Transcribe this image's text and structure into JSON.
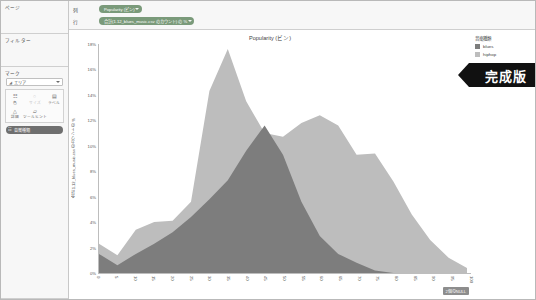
{
  "sidebar": {
    "pages_title": "ページ",
    "filters_title": "フィルター",
    "marks_title": "マーク",
    "marks_type": "エリア",
    "marks_type_icon": "area-mark-icon",
    "mark_buttons": [
      {
        "icon": "color-icon",
        "glyph": "⠿",
        "label": "色"
      },
      {
        "icon": "size-icon",
        "glyph": "○",
        "label": "サイズ",
        "dim": true
      },
      {
        "icon": "label-icon",
        "glyph": "▤",
        "label": "ラベル"
      },
      {
        "icon": "detail-icon",
        "glyph": "△",
        "label": "詳細"
      },
      {
        "icon": "tooltip-icon",
        "glyph": "◱",
        "label": "ツールヒント"
      }
    ],
    "marks_pill": "音楽種類",
    "marks_pill_icon": "dimension-pill-icon"
  },
  "shelves": {
    "columns_label": "列",
    "rows_label": "行",
    "columns_pill": "Popularity (ビン)",
    "rows_pill": "合計(1.12_blues_music.csv のカウント) の %"
  },
  "legend": {
    "title": "音楽種類",
    "items": [
      {
        "label": "blues",
        "color": "#7d7d7d"
      },
      {
        "label": "hiphop",
        "color": "#bdbdbd"
      }
    ]
  },
  "ribbon": {
    "label": "完成版"
  },
  "null_badge": {
    "label": "2個のNULL"
  },
  "chart_data": {
    "type": "area",
    "title": "Popularity (ビン)",
    "xlabel": "",
    "ylabel": "合計 1.12_blues_music.csv のカウント の %",
    "xlim": [
      0,
      100
    ],
    "ylim": [
      0,
      18
    ],
    "grid": false,
    "legend_position": "right",
    "y_tick_labels": [
      "0%",
      "2%",
      "4%",
      "6%",
      "8%",
      "10%",
      "12%",
      "14%",
      "16%",
      "18%"
    ],
    "y_ticks": [
      0,
      2,
      4,
      6,
      8,
      10,
      12,
      14,
      16,
      18
    ],
    "x_tick_labels": [
      "0",
      "5",
      "10",
      "15",
      "20",
      "25",
      "30",
      "35",
      "40",
      "45",
      "50",
      "55",
      "60",
      "65",
      "70",
      "75",
      "80",
      "85",
      "90",
      "95",
      "100"
    ],
    "x": [
      0,
      5,
      10,
      15,
      20,
      25,
      30,
      35,
      40,
      45,
      50,
      55,
      60,
      65,
      70,
      75,
      80,
      85,
      90,
      95,
      100
    ],
    "series": [
      {
        "name": "blues",
        "color": "#7d7d7d",
        "values": [
          1.5,
          0.6,
          1.5,
          2.3,
          3.2,
          4.4,
          5.8,
          7.3,
          9.6,
          11.6,
          9.3,
          5.6,
          2.9,
          1.5,
          0.8,
          0.2,
          0.0,
          0.0,
          0.0,
          0.0,
          0.0
        ]
      },
      {
        "name": "hiphop",
        "color": "#bdbdbd",
        "values": [
          2.3,
          1.4,
          3.4,
          4.0,
          4.1,
          5.6,
          14.3,
          17.6,
          13.5,
          11.0,
          10.7,
          11.8,
          12.4,
          11.6,
          9.3,
          9.4,
          7.2,
          4.6,
          2.6,
          1.2,
          0.4
        ]
      }
    ]
  }
}
